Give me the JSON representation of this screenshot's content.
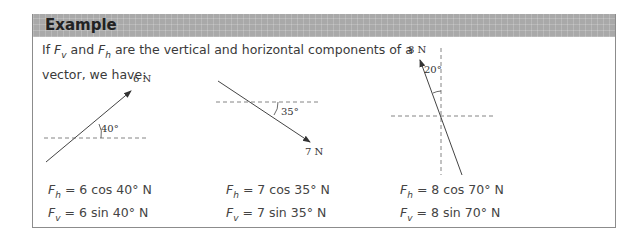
{
  "header": {
    "title": "Example"
  },
  "intro": {
    "line1_prefix": "If ",
    "fv": "F",
    "fv_sub": "v",
    "and": " and ",
    "fh": "F",
    "fh_sub": "h",
    "line1_suffix": " are the vertical and horizontal components of a",
    "line2": "vector, we have:"
  },
  "diagrams": [
    {
      "force_label": "6 N",
      "angle_label": "40°",
      "angle_deg": 40,
      "direction": "up-right"
    },
    {
      "force_label": "7 N",
      "angle_label": "35°",
      "angle_deg": 35,
      "direction": "down-right"
    },
    {
      "force_label": "8 N",
      "angle_label": "20°",
      "angle_deg": 20,
      "direction": "up-left-from-vertical"
    }
  ],
  "equations": [
    {
      "fh_rhs": " = 6 cos 40° N",
      "fv_rhs": " = 6 sin 40° N"
    },
    {
      "fh_rhs": " = 7 cos 35° N",
      "fv_rhs": " = 7 sin 35° N"
    },
    {
      "fh_rhs": " = 8 cos 70° N",
      "fv_rhs": " = 8 sin 70° N"
    }
  ],
  "symbols": {
    "F": "F",
    "h": "h",
    "v": "v"
  },
  "colors": {
    "header_bg": "#a9a9a9",
    "border": "#8c8c8c",
    "text": "#333333"
  }
}
